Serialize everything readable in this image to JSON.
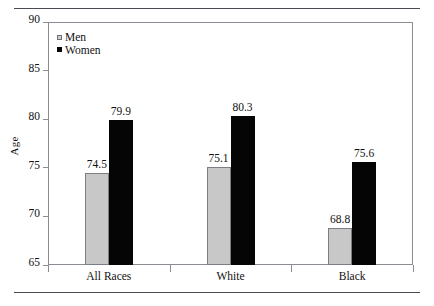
{
  "chart_data": {
    "type": "bar",
    "title": "",
    "subtitle": "",
    "xlabel": "",
    "ylabel": "Age",
    "categories": [
      "All Races",
      "White",
      "Black"
    ],
    "series": [
      {
        "name": "Men",
        "color": "#c8c8c8",
        "values": [
          74.5,
          75.1,
          68.8
        ]
      },
      {
        "name": "Women",
        "color": "#050505",
        "values": [
          79.9,
          80.3,
          75.6
        ]
      }
    ],
    "ylim": [
      65,
      90
    ],
    "ytick_labels": [
      "90",
      "85",
      "80",
      "75",
      "70",
      "65"
    ],
    "ytick_values": [
      90,
      85,
      80,
      75,
      70,
      65
    ],
    "grid": false,
    "legend_position": "top-left",
    "data_labels": [
      "74.5",
      "79.9",
      "75.1",
      "80.3",
      "68.8",
      "75.6"
    ],
    "frame_color": "#8c8c94",
    "rule_color": "#4a4a52"
  }
}
